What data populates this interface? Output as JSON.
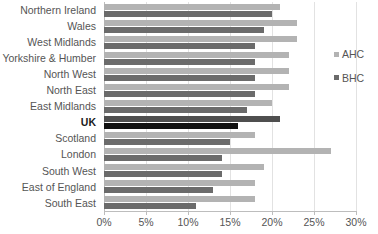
{
  "legend": {
    "position": "right",
    "items": [
      {
        "label": "AHC",
        "color": "#b3b3b3",
        "swatch_name": "legend-swatch-ahc"
      },
      {
        "label": "BHC",
        "color": "#6b6b6b",
        "swatch_name": "legend-swatch-bhc"
      }
    ]
  },
  "axis": {
    "tick_labels": [
      "0%",
      "5%",
      "10%",
      "15%",
      "20%",
      "25%",
      "30%"
    ],
    "tick_values": [
      0,
      5,
      10,
      15,
      20,
      25,
      30
    ]
  },
  "highlight": {
    "category": "UK",
    "ahc_color": "#4f4f4f",
    "bhc_color": "#111111"
  },
  "chart_data": {
    "type": "bar",
    "orientation": "horizontal",
    "title": "",
    "xlabel": "",
    "ylabel": "",
    "xlim": [
      0,
      30
    ],
    "grid": true,
    "legend_position": "right",
    "categories": [
      "Northern Ireland",
      "Wales",
      "West Midlands",
      "Yorkshire & Humber",
      "North West",
      "North East",
      "East Midlands",
      "UK",
      "Scotland",
      "London",
      "South West",
      "East of England",
      "South East"
    ],
    "series": [
      {
        "name": "AHC",
        "color": "#b3b3b3",
        "values": [
          21,
          23,
          23,
          22,
          22,
          22,
          20,
          21,
          18,
          27,
          19,
          18,
          18
        ]
      },
      {
        "name": "BHC",
        "color": "#6b6b6b",
        "values": [
          20,
          19,
          18,
          18,
          18,
          18,
          17,
          16,
          15,
          14,
          14,
          13,
          11
        ]
      }
    ]
  }
}
